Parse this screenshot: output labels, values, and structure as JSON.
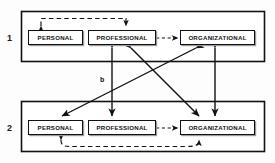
{
  "figure": {
    "background_color": "#fdfdfd",
    "line_color": "#111111",
    "panels": [
      {
        "number": "1",
        "nodes": [
          {
            "id": "p1-personal",
            "label": "PERSONAL"
          },
          {
            "id": "p1-professional",
            "label": "PROFESSIONAL"
          },
          {
            "id": "p1-organizational",
            "label": "ORGANIZATIONAL"
          }
        ]
      },
      {
        "number": "2",
        "nodes": [
          {
            "id": "p2-personal",
            "label": "PERSONAL"
          },
          {
            "id": "p2-professional",
            "label": "PROFESSIONAL"
          },
          {
            "id": "p2-organizational",
            "label": "ORGANIZATIONAL"
          }
        ]
      }
    ],
    "edge_labels": [
      {
        "id": "edge-label-a",
        "text": "a"
      },
      {
        "id": "edge-label-b",
        "text": "b"
      }
    ],
    "edges": [
      {
        "id": "p1-personal-professional-dashed-arc",
        "style": "dashed",
        "heads": "both",
        "label": "a"
      },
      {
        "id": "p1-professional-organizational-dashed",
        "style": "dashed",
        "heads": "both"
      },
      {
        "id": "p2-professional-organizational-dashed",
        "style": "dashed",
        "heads": "both"
      },
      {
        "id": "p2-personal-organizational-dashed-arc",
        "style": "dashed",
        "heads": "both"
      },
      {
        "id": "professional-1-to-professional-2-vertical",
        "style": "solid",
        "heads": "both",
        "label": "b"
      },
      {
        "id": "organizational-1-to-organizational-2-vertical",
        "style": "solid",
        "heads": "both"
      },
      {
        "id": "professional-1-to-organizational-2-diagonal",
        "style": "solid",
        "heads": "both"
      },
      {
        "id": "organizational-1-to-personal-2-diagonal",
        "style": "solid",
        "heads": "both"
      }
    ]
  }
}
